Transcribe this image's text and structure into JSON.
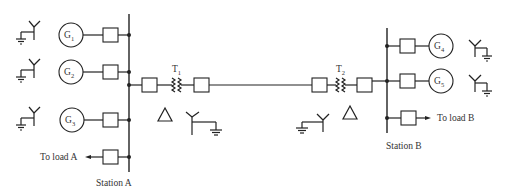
{
  "diagram": {
    "stations": [
      {
        "id": "A",
        "label": "Station A"
      },
      {
        "id": "B",
        "label": "Station B"
      }
    ],
    "generators": [
      {
        "id": "G1",
        "symbol": "G",
        "subscript": "1",
        "station": "A",
        "grounding": "wye-grounded"
      },
      {
        "id": "G2",
        "symbol": "G",
        "subscript": "2",
        "station": "A",
        "grounding": "wye-grounded"
      },
      {
        "id": "G3",
        "symbol": "G",
        "subscript": "3",
        "station": "A",
        "grounding": "wye-grounded"
      },
      {
        "id": "G4",
        "symbol": "G",
        "subscript": "4",
        "station": "B",
        "grounding": "wye-grounded"
      },
      {
        "id": "G5",
        "symbol": "G",
        "subscript": "5",
        "station": "B",
        "grounding": "wye-grounded"
      }
    ],
    "transformers": [
      {
        "id": "T1",
        "symbol": "T",
        "subscript": "1",
        "windings": [
          "delta",
          "wye-grounded"
        ]
      },
      {
        "id": "T2",
        "symbol": "T",
        "subscript": "2",
        "windings": [
          "wye-grounded",
          "delta"
        ]
      }
    ],
    "loads": [
      {
        "id": "loadA",
        "label": "To load A",
        "station": "A"
      },
      {
        "id": "loadB",
        "label": "To load B",
        "station": "B"
      }
    ],
    "connections": [
      "G1 -> breaker -> Station A bus",
      "G2 -> breaker -> Station A bus",
      "G3 -> breaker -> Station A bus",
      "Station A bus -> breaker -> load A",
      "Station A bus -> breaker -> T1 -> breaker -> line -> breaker -> T2 -> breaker -> Station B bus",
      "G4 -> breaker -> Station B bus",
      "G5 -> breaker -> Station B bus",
      "Station B bus -> breaker -> load B"
    ]
  }
}
